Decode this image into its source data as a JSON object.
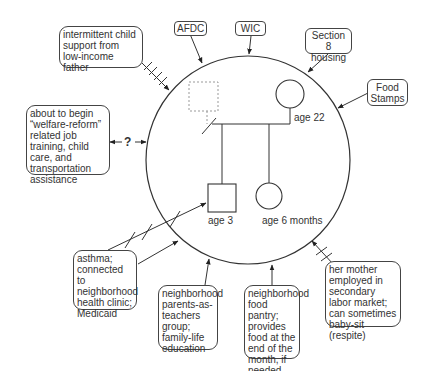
{
  "diagram": {
    "type": "ecomap",
    "household": {
      "members": [
        {
          "id": "father",
          "symbol": "square-dashed",
          "label": "",
          "status": "absent"
        },
        {
          "id": "mother",
          "symbol": "circle",
          "label": "age 22"
        },
        {
          "id": "son",
          "symbol": "square",
          "label": "age 3"
        },
        {
          "id": "daughter",
          "symbol": "circle",
          "label": "age 6 months"
        }
      ]
    },
    "resources": [
      {
        "id": "child-support",
        "text": "intermittent child support from low-income father",
        "connection": "stressful",
        "direction": "inward"
      },
      {
        "id": "afdc",
        "text": "AFDC",
        "connection": "normal",
        "direction": "inward"
      },
      {
        "id": "wic",
        "text": "WIC",
        "connection": "normal",
        "direction": "inward"
      },
      {
        "id": "section8",
        "text": "Section 8 housing",
        "connection": "normal",
        "direction": "inward"
      },
      {
        "id": "food-stamps",
        "text": "Food Stamps",
        "connection": "normal",
        "direction": "inward"
      },
      {
        "id": "welfare-reform",
        "text": "about to begin “welfare-reform” related job training, child care, and transportation assistance",
        "connection": "uncertain",
        "marker": "?"
      },
      {
        "id": "asthma",
        "text": "asthma; connected to neighborhood health clinic; Medicaid",
        "connection": "stressful+normal",
        "direction": "inward"
      },
      {
        "id": "parents-teachers",
        "text": "neighborhood parents-as-teachers group; family-life education",
        "connection": "normal",
        "direction": "inward"
      },
      {
        "id": "food-pantry",
        "text": "neighborhood food pantry; provides food at the end of the month, if needed",
        "connection": "normal",
        "direction": "inward"
      },
      {
        "id": "mother-employed",
        "text": "her mother employed in secondary labor market; can sometimes baby-sit (respite)",
        "connection": "stressful",
        "direction": "inward"
      }
    ],
    "labels": {
      "mother_age": "age 22",
      "son_age": "age 3",
      "daughter_age": "age 6 months",
      "uncertain_marker": "?"
    },
    "colors": {
      "line": "#333333",
      "dashed": "#888888",
      "background": "#ffffff"
    }
  }
}
